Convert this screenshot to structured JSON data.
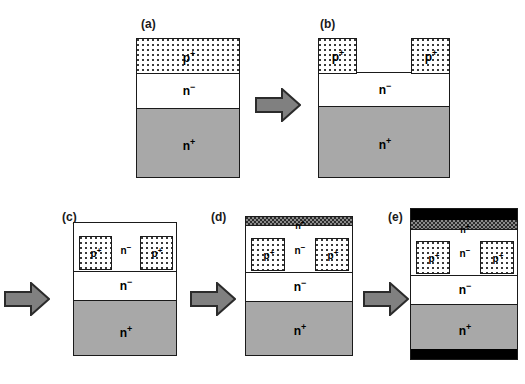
{
  "figure": {
    "type": "process-flow-cross-section",
    "colors": {
      "nplus_substrate": "#a8a8a8",
      "nminus": "#ffffff",
      "pplus_stipple": "#3a3a3a",
      "metal": "#000000",
      "nplus_top_band": "#8a8a8a",
      "outline": "#1a1a1a",
      "arrow_fill": "#808080"
    }
  },
  "labels": {
    "pplus": "p",
    "pplus_sup": "+",
    "nminus": "n",
    "nminus_sup": "−",
    "nplus": "n",
    "nplus_sup": "+"
  },
  "stages": [
    {
      "id": "a",
      "caption": "(a)",
      "layers": [
        {
          "name": "p-plus-epilayer",
          "material": "p+"
        },
        {
          "name": "n-minus-drift",
          "material": "n−"
        },
        {
          "name": "n-plus-substrate",
          "material": "n+"
        }
      ]
    },
    {
      "id": "b",
      "caption": "(b)",
      "layers": [
        {
          "name": "p-plus-left-pillar",
          "material": "p+"
        },
        {
          "name": "p-plus-right-pillar",
          "material": "p+"
        },
        {
          "name": "n-minus-drift",
          "material": "n−"
        },
        {
          "name": "n-plus-substrate",
          "material": "n+"
        }
      ]
    },
    {
      "id": "c",
      "caption": "(c)",
      "layers": [
        {
          "name": "p-plus-left-pillar",
          "material": "p+"
        },
        {
          "name": "n-minus-regrown-channel",
          "material": "n−"
        },
        {
          "name": "p-plus-right-pillar",
          "material": "p+"
        },
        {
          "name": "n-minus-drift",
          "material": "n−"
        },
        {
          "name": "n-plus-substrate",
          "material": "n+"
        }
      ]
    },
    {
      "id": "d",
      "caption": "(d)",
      "layers": [
        {
          "name": "n-plus-source-cap",
          "material": "n+"
        },
        {
          "name": "p-plus-left-pillar",
          "material": "p+"
        },
        {
          "name": "n-minus-regrown-channel",
          "material": "n−"
        },
        {
          "name": "p-plus-right-pillar",
          "material": "p+"
        },
        {
          "name": "n-minus-drift",
          "material": "n−"
        },
        {
          "name": "n-plus-substrate",
          "material": "n+"
        }
      ]
    },
    {
      "id": "e",
      "caption": "(e)",
      "layers": [
        {
          "name": "top-metal-contact",
          "material": "metal"
        },
        {
          "name": "n-plus-source-cap",
          "material": "n+"
        },
        {
          "name": "p-plus-left-pillar",
          "material": "p+"
        },
        {
          "name": "n-minus-regrown-channel",
          "material": "n−"
        },
        {
          "name": "p-plus-right-pillar",
          "material": "p+"
        },
        {
          "name": "n-minus-drift",
          "material": "n−"
        },
        {
          "name": "n-plus-substrate",
          "material": "n+"
        },
        {
          "name": "bottom-metal-contact",
          "material": "metal"
        }
      ]
    }
  ],
  "arrows": [
    {
      "name": "arrow-a-to-b",
      "direction": "right"
    },
    {
      "name": "arrow-b-to-c",
      "direction": "right"
    },
    {
      "name": "arrow-c-to-d",
      "direction": "right"
    },
    {
      "name": "arrow-d-to-e",
      "direction": "right"
    }
  ]
}
